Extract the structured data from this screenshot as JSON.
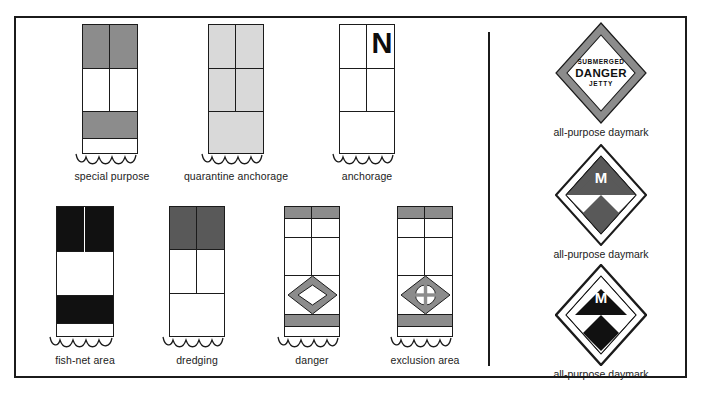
{
  "figure": {
    "type": "nautical-buoy-and-daymark-legend",
    "panels": [
      "buoys",
      "daymarks"
    ]
  },
  "colors": {
    "outline": "#1b1b1b",
    "gray_mid": "#8c8c8c",
    "gray_light": "#d9d9d9",
    "gray_dark": "#595959",
    "black": "#111111",
    "white": "#ffffff",
    "page_bg": "#ffffff"
  },
  "buoys": [
    {
      "id": "special-purpose",
      "label": "special purpose",
      "marking": "gray over white with gray band",
      "top_color": "#8c8c8c",
      "band_color": "#8c8c8c",
      "letter": ""
    },
    {
      "id": "quarantine-anchorage",
      "label": "quarantine anchorage",
      "marking": "solid light gray (yellow)",
      "top_color": "#d9d9d9",
      "band_color": "#d9d9d9",
      "letter": ""
    },
    {
      "id": "anchorage",
      "label": "anchorage",
      "marking": "white with letter N",
      "top_color": "#ffffff",
      "band_color": "#ffffff",
      "letter": "N"
    },
    {
      "id": "fish-net-area",
      "label": "fish-net area",
      "marking": "black over white with black band",
      "top_color": "#111111",
      "band_color": "#111111",
      "letter": ""
    },
    {
      "id": "dredging",
      "label": "dredging",
      "marking": "dark gray top over white",
      "top_color": "#595959",
      "band_color": "#ffffff",
      "letter": ""
    },
    {
      "id": "danger",
      "label": "danger",
      "marking": "white with gray bands and open diamond",
      "top_color": "#8c8c8c",
      "band_color": "#8c8c8c",
      "symbol": "open-diamond",
      "letter": ""
    },
    {
      "id": "exclusion-area",
      "label": "exclusion area",
      "marking": "white with gray bands and filled diamond with cross",
      "top_color": "#8c8c8c",
      "band_color": "#8c8c8c",
      "symbol": "filled-diamond-cross",
      "letter": ""
    }
  ],
  "daymarks": [
    {
      "id": "daymark-submerged-danger-jetty",
      "caption": "all-purpose daymark",
      "border_color": "#8c8c8c",
      "text_line1": "SUBMERGED",
      "text_line2": "DANGER",
      "text_line3": "JETTY",
      "letter": ""
    },
    {
      "id": "daymark-gray-m",
      "caption": "all-purpose daymark",
      "border_color": "#1b1b1b",
      "quarter_color": "#595959",
      "letter": "M"
    },
    {
      "id": "daymark-black-m",
      "caption": "all-purpose daymark",
      "border_color": "#1b1b1b",
      "quarter_color": "#111111",
      "letter": "M"
    }
  ]
}
